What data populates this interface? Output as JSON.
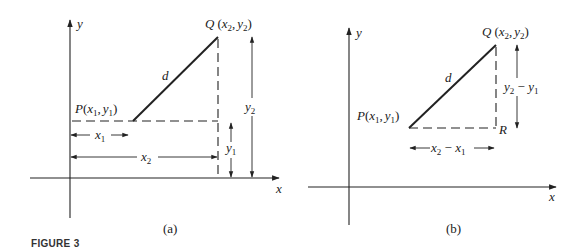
{
  "figure_caption": "FIGURE 3",
  "panel_a": {
    "caption": "(a)",
    "axis_x_label": "x",
    "axis_y_label": "y",
    "point_p": {
      "name": "P",
      "coords_open": "(",
      "x": "x",
      "x_sub": "1",
      "sep": ",",
      "y": "y",
      "y_sub": "1",
      "coords_close": ")"
    },
    "point_q": {
      "name": "Q",
      "coords_open": "(",
      "x": "x",
      "x_sub": "2",
      "sep": ",",
      "y": "y",
      "y_sub": "2",
      "coords_close": ")"
    },
    "distance_label": "d",
    "dim_x1": {
      "var": "x",
      "sub": "1"
    },
    "dim_x2": {
      "var": "x",
      "sub": "2"
    },
    "dim_y1": {
      "var": "y",
      "sub": "1"
    },
    "dim_y2": {
      "var": "y",
      "sub": "2"
    }
  },
  "panel_b": {
    "caption": "(b)",
    "axis_x_label": "x",
    "axis_y_label": "y",
    "point_p": {
      "name": "P",
      "coords_open": "(",
      "x": "x",
      "x_sub": "1",
      "sep": ",",
      "y": "y",
      "y_sub": "1",
      "coords_close": ")"
    },
    "point_q": {
      "name": "Q",
      "coords_open": "(",
      "x": "x",
      "x_sub": "2",
      "sep": ",",
      "y": "y",
      "y_sub": "2",
      "coords_close": ")"
    },
    "point_r": "R",
    "distance_label": "d",
    "dim_dx": {
      "a": "x",
      "a_sub": "2",
      "minus": " − ",
      "b": "x",
      "b_sub": "1"
    },
    "dim_dy": {
      "a": "y",
      "a_sub": "2",
      "minus": " − ",
      "b": "y",
      "b_sub": "1"
    }
  }
}
